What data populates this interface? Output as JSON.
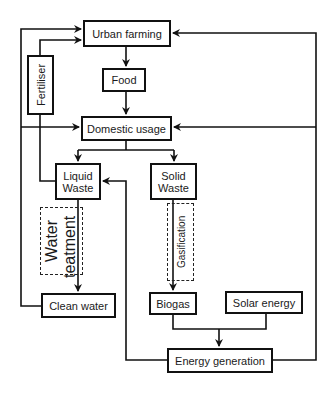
{
  "diagram": {
    "nodes": {
      "urban_farming": "Urban farming",
      "food": "Food",
      "domestic_usage": "Domestic usage",
      "fertiliser": "Fertiliser",
      "liquid_waste_line1": "Liquid",
      "liquid_waste_line2": "Waste",
      "solid_waste_line1": "Solid",
      "solid_waste_line2": "Waste",
      "water_treatment_line1": "Water",
      "water_treatment_line2": "teatment",
      "gasification": "Gasification",
      "clean_water": "Clean water",
      "biogas": "Biogas",
      "solar_energy": "Solar energy",
      "energy_generation": "Energy generation"
    },
    "edges": [
      {
        "from": "Urban farming",
        "to": "Food"
      },
      {
        "from": "Food",
        "to": "Domestic usage"
      },
      {
        "from": "Domestic usage",
        "to": "Liquid Waste"
      },
      {
        "from": "Domestic usage",
        "to": "Solid Waste"
      },
      {
        "from": "Liquid Waste",
        "to": "Fertiliser"
      },
      {
        "from": "Fertiliser",
        "to": "Urban farming"
      },
      {
        "from": "Liquid Waste",
        "to": "Clean water",
        "via": "Water teatment"
      },
      {
        "from": "Clean water",
        "to": "Urban farming"
      },
      {
        "from": "Clean water",
        "to": "Domestic usage"
      },
      {
        "from": "Solid Waste",
        "to": "Biogas",
        "via": "Gasification"
      },
      {
        "from": "Biogas",
        "to": "Energy generation"
      },
      {
        "from": "Solar energy",
        "to": "Energy generation"
      },
      {
        "from": "Energy generation",
        "to": "Liquid Waste"
      },
      {
        "from": "Energy generation",
        "to": "Urban farming"
      },
      {
        "from": "Energy generation",
        "to": "Domestic usage"
      }
    ]
  }
}
